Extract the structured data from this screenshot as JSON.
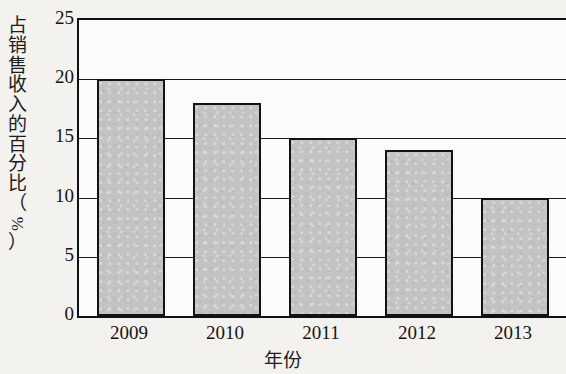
{
  "chart_data": {
    "type": "bar",
    "title": "",
    "categories": [
      "2009",
      "2010",
      "2011",
      "2012",
      "2013"
    ],
    "values": [
      20,
      18,
      15,
      14,
      10
    ],
    "series": [
      {
        "name": "占销售收入的百分比",
        "values": [
          20,
          18,
          15,
          14,
          10
        ]
      }
    ],
    "xlabel": "年份",
    "ylabel": "占销售收入的百分比（%）",
    "ylabel_chars": [
      "占",
      "销",
      "售",
      "收",
      "入",
      "的",
      "百",
      "分",
      "比"
    ],
    "ylabel_paren_open": "（",
    "ylabel_unit": "%",
    "ylabel_paren_close": "）",
    "ylim": [
      0,
      25
    ],
    "ytick_values": [
      25,
      20,
      15,
      10,
      5,
      0
    ],
    "ytick_labels": [
      "25",
      "20",
      "15",
      "10",
      "5",
      "0"
    ],
    "ytick_step": 5,
    "grid": true,
    "grid_axis": "y",
    "legend": false,
    "legend_position": "none",
    "bar_fill_color": "#c3c3c3",
    "bar_edge_color": "#131313",
    "axis_color": "#111111",
    "background_color": "#f3f2ef",
    "plot_background_color": "#fbfbfa",
    "value_unit": "%"
  }
}
